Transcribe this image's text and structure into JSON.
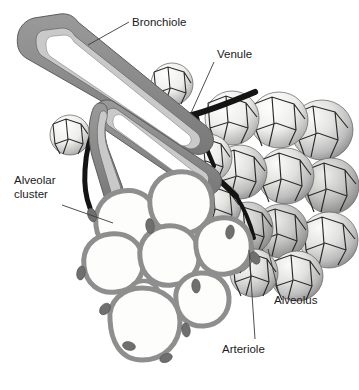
{
  "figure": {
    "background_color": "#ffffff"
  },
  "labels": {
    "bronchiole": "Bronchiole",
    "venule": "Venule",
    "alveolar_cluster_line1": "Alveolar",
    "alveolar_cluster_line2": "cluster",
    "alveolus": "Alveolus",
    "arteriole": "Arteriole"
  },
  "colors": {
    "bronchiole_wall": "#8a8a8a",
    "bronchiole_lining": "#c9c9c9",
    "bronchiole_lumen": "#ffffff",
    "alveolar_wall": "#8e8e8e",
    "alveolar_lumen": "#fdfdfb",
    "capillary_dot": "#6f6f6f",
    "vessel_dark": "#141414",
    "alveolus_shade_light": "#f2f2f0",
    "alveolus_shade_mid": "#cfcfcf",
    "alveolus_shade_dark": "#8d8d8d",
    "capillary_mesh": "#2a2a2a",
    "label_text": "#1a1a1a",
    "leader_line": "#3a3a3a"
  },
  "structures": [
    {
      "name": "bronchiole",
      "description": "Large gray airway tube entering from upper left, cut away to reveal white lumen with light gray lining, branching into two smaller airways"
    },
    {
      "name": "alveolar-cluster",
      "description": "Grape-like cluster of outlined white alveolar sacs at lower left with thick gray walls and capillary cross-sections"
    },
    {
      "name": "alveoli-shaded",
      "description": "Shaded three dimensional alveoli on the right covered by a dark polygonal capillary network"
    },
    {
      "name": "venule",
      "description": "Dark vessel crossing from upper right toward the bronchiole carrying blood away"
    },
    {
      "name": "arteriole",
      "description": "Dark vessel descending from the bronchiole toward the lower alveoli carrying blood in"
    }
  ]
}
